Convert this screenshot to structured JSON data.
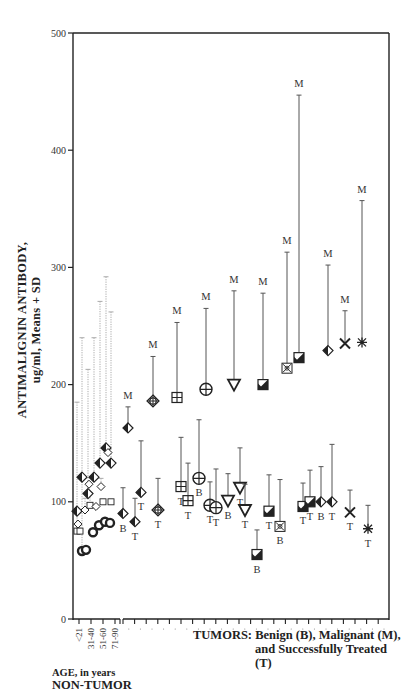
{
  "chart_data": {
    "type": "scatter",
    "title": "",
    "ylabel": "ANTIMALIGNIN ANTIBODY, ug/ml, Means + SD",
    "ylabel_line1": "ANTIMALIGNIN  ANTIBODY,",
    "ylabel_line2": "ug/ml, Means + SD",
    "xlabel_tumor_line1": "TUMORS: Benign (B), Malignant (M),",
    "xlabel_tumor_line2": "and Successfully Treated (T)",
    "xlabel_age": "AGE, in years",
    "xlabel_nontumor": "NON-TUMOR",
    "ylim": [
      0,
      500
    ],
    "yticks": [
      0,
      100,
      200,
      300,
      400,
      500
    ],
    "grid": false,
    "legend": "none (letters B, M, T annotate points)",
    "age_groups": [
      "<21",
      "31-40",
      "51-60",
      "71-90"
    ],
    "non_tumor": [
      {
        "x": 77,
        "symbol": "halfdiamond",
        "mean": 92,
        "sd_top": 92
      },
      {
        "x": 78,
        "symbol": "diamond",
        "mean": 81,
        "sd_top": 81
      },
      {
        "x": 77,
        "symbol": "square",
        "mean": 75,
        "sd_top": 185
      },
      {
        "x": 80,
        "symbol": "square",
        "mean": 75,
        "sd_top": 75
      },
      {
        "x": 82,
        "symbol": "circle",
        "mean": 58,
        "sd_top": 240
      },
      {
        "x": 86,
        "symbol": "circle",
        "mean": 59,
        "sd_top": 59
      },
      {
        "x": 82,
        "symbol": "halfdiamond",
        "mean": 121,
        "sd_top": 121
      },
      {
        "x": 85,
        "symbol": "diamond",
        "mean": 93,
        "sd_top": 103
      },
      {
        "x": 88,
        "symbol": "halfdiamond",
        "mean": 107,
        "sd_top": 213
      },
      {
        "x": 89,
        "symbol": "diamond",
        "mean": 115,
        "sd_top": 115
      },
      {
        "x": 90,
        "symbol": "square",
        "mean": 97,
        "sd_top": 108
      },
      {
        "x": 93,
        "symbol": "circle",
        "mean": 74,
        "sd_top": 74
      },
      {
        "x": 94,
        "symbol": "halfdiamond",
        "mean": 121,
        "sd_top": 240
      },
      {
        "x": 96,
        "symbol": "diamond",
        "mean": 96,
        "sd_top": 96
      },
      {
        "x": 99,
        "symbol": "circle",
        "mean": 80,
        "sd_top": 80
      },
      {
        "x": 100,
        "symbol": "halfdiamond",
        "mean": 133,
        "sd_top": 271
      },
      {
        "x": 101,
        "symbol": "diamond",
        "mean": 113,
        "sd_top": 120
      },
      {
        "x": 103,
        "symbol": "square",
        "mean": 100,
        "sd_top": 100
      },
      {
        "x": 105,
        "symbol": "circle",
        "mean": 83,
        "sd_top": 83
      },
      {
        "x": 106,
        "symbol": "halfdiamond",
        "mean": 146,
        "sd_top": 292
      },
      {
        "x": 108,
        "symbol": "diamond",
        "mean": 142,
        "sd_top": 142
      },
      {
        "x": 110,
        "symbol": "circle",
        "mean": 82,
        "sd_top": 82
      },
      {
        "x": 111,
        "symbol": "halfdiamond",
        "mean": 133,
        "sd_top": 262
      },
      {
        "x": 111,
        "symbol": "square",
        "mean": 100,
        "sd_top": 100
      }
    ],
    "tumor_groups": [
      {
        "id": 1,
        "symbol": "halfdiamond",
        "points": [
          {
            "label": "M",
            "x": 128,
            "mean": 163,
            "sd_top": 181
          },
          {
            "label": "B",
            "x": 123,
            "mean": 90,
            "sd_top": 112
          },
          {
            "label": "T",
            "x": 135,
            "mean": 83,
            "sd_top": 103
          },
          {
            "label": "T",
            "x": 141,
            "mean": 108,
            "sd_top": 152
          }
        ]
      },
      {
        "id": 2,
        "symbol": "diamondplus",
        "points": [
          {
            "label": "M",
            "x": 153,
            "mean": 186,
            "sd_top": 224
          },
          {
            "label": "T",
            "x": 158,
            "mean": 93,
            "sd_top": 120
          }
        ]
      },
      {
        "id": 3,
        "symbol": "gridsquare",
        "points": [
          {
            "label": "M",
            "x": 177,
            "mean": 189,
            "sd_top": 253
          },
          {
            "label": "T",
            "x": 181,
            "mean": 113,
            "sd_top": 155
          },
          {
            "label": "T",
            "x": 188,
            "mean": 101,
            "sd_top": 133
          }
        ]
      },
      {
        "id": 4,
        "symbol": "circleplus",
        "points": [
          {
            "label": "M",
            "x": 206,
            "mean": 196,
            "sd_top": 265
          },
          {
            "label": "B",
            "x": 199,
            "mean": 120,
            "sd_top": 170
          },
          {
            "label": "T",
            "x": 210,
            "mean": 97,
            "sd_top": 117
          },
          {
            "label": "T",
            "x": 216,
            "mean": 95,
            "sd_top": 128
          }
        ]
      },
      {
        "id": 5,
        "symbol": "triangle",
        "points": [
          {
            "label": "M",
            "x": 234,
            "mean": 200,
            "sd_top": 280
          },
          {
            "label": "B",
            "x": 228,
            "mean": 101,
            "sd_top": 124
          },
          {
            "label": "T",
            "x": 240,
            "mean": 112,
            "sd_top": 146
          },
          {
            "label": "T",
            "x": 245,
            "mean": 93,
            "sd_top": 115
          }
        ]
      },
      {
        "id": 6,
        "symbol": "halfsquare",
        "points": [
          {
            "label": "M",
            "x": 263,
            "mean": 200,
            "sd_top": 278
          },
          {
            "label": "B",
            "x": 257,
            "mean": 55,
            "sd_top": 76
          },
          {
            "label": "T",
            "x": 269,
            "mean": 92,
            "sd_top": 123
          }
        ]
      },
      {
        "id": 7,
        "symbol": "xsquare",
        "points": [
          {
            "label": "M",
            "x": 287,
            "mean": 214,
            "sd_top": 313
          },
          {
            "label": "B",
            "x": 280,
            "mean": 79,
            "sd_top": 119
          }
        ]
      },
      {
        "id": 8,
        "symbol": "halfsquare",
        "points": [
          {
            "label": "M",
            "x": 299,
            "mean": 223,
            "sd_top": 447
          },
          {
            "label": "T",
            "x": 303,
            "mean": 96,
            "sd_top": 116
          },
          {
            "label": "T",
            "x": 310,
            "mean": 100,
            "sd_top": 127
          }
        ]
      },
      {
        "id": 9,
        "symbol": "halfdiamond",
        "points": [
          {
            "label": "M",
            "x": 328,
            "mean": 229,
            "sd_top": 302
          },
          {
            "label": "B",
            "x": 321,
            "mean": 100,
            "sd_top": 130
          },
          {
            "label": "T",
            "x": 332,
            "mean": 100,
            "sd_top": 149
          }
        ]
      },
      {
        "id": 10,
        "symbol": "x",
        "points": [
          {
            "label": "M",
            "x": 345,
            "mean": 235,
            "sd_top": 263
          },
          {
            "label": "T",
            "x": 350,
            "mean": 91,
            "sd_top": 110
          }
        ]
      },
      {
        "id": 11,
        "symbol": "asterisk",
        "points": [
          {
            "label": "M",
            "x": 362,
            "mean": 236,
            "sd_top": 357
          },
          {
            "label": "T",
            "x": 368,
            "mean": 77,
            "sd_top": 97
          }
        ]
      }
    ]
  },
  "axis": {
    "y_ticks": [
      "0",
      "100",
      "200",
      "300",
      "400",
      "500"
    ],
    "age_ticks": [
      "<21",
      "31-40",
      "51-60",
      "71-90"
    ]
  },
  "labels": {
    "ylabel_line1": "ANTIMALIGNIN  ANTIBODY,",
    "ylabel_line2": "ug/ml, Means + SD",
    "tumor_line1": "TUMORS:  Benign  (B),  Malignant  (M),",
    "tumor_line2": "and Successfully Treated (T)",
    "age": "AGE, in years",
    "nontumor": "NON-TUMOR"
  }
}
